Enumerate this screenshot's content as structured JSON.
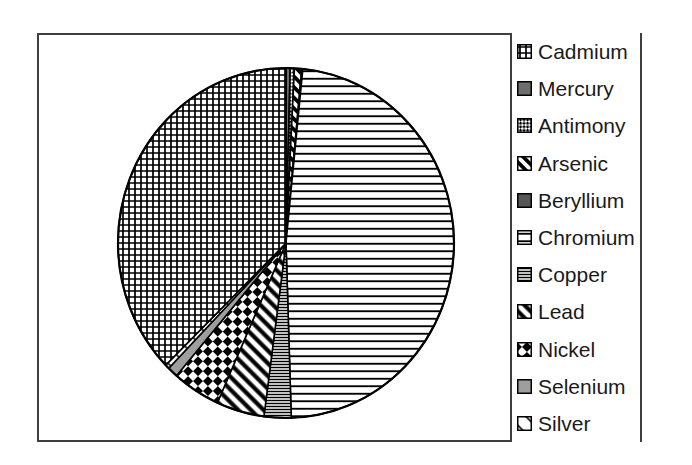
{
  "chart_data": {
    "type": "pie",
    "labels": [
      "Cadmium",
      "Mercury",
      "Antimony",
      "Arsenic",
      "Beryllium",
      "Chromium",
      "Copper",
      "Lead",
      "Nickel",
      "Selenium",
      "Silver"
    ],
    "values": [
      37.3,
      0.4,
      0.4,
      0.7,
      0.1,
      47.9,
      2.6,
      4.6,
      4.6,
      1.0,
      0.4
    ],
    "unit": "percent",
    "title": "",
    "legend_position": "right",
    "direction": "clockwise",
    "start_angle_deg": 0,
    "draw_order": [
      "Mercury",
      "Antimony",
      "Arsenic",
      "Beryllium",
      "Chromium",
      "Copper",
      "Lead",
      "Nickel",
      "Selenium",
      "Silver",
      "Cadmium"
    ]
  },
  "legend": {
    "items": [
      {
        "label": "Cadmium",
        "pattern": "crosshatch-grid"
      },
      {
        "label": "Mercury",
        "pattern": "solid-gray"
      },
      {
        "label": "Antimony",
        "pattern": "fine-diamond-check"
      },
      {
        "label": "Arsenic",
        "pattern": "thick-diagonal"
      },
      {
        "label": "Beryllium",
        "pattern": "solid-dark-gray"
      },
      {
        "label": "Chromium",
        "pattern": "sparse-horizontal"
      },
      {
        "label": "Copper",
        "pattern": "dense-horizontal"
      },
      {
        "label": "Lead",
        "pattern": "wide-diagonal"
      },
      {
        "label": "Nickel",
        "pattern": "diamond-check"
      },
      {
        "label": "Selenium",
        "pattern": "solid-light-gray"
      },
      {
        "label": "Silver",
        "pattern": "sparse-thin-diagonal"
      }
    ]
  },
  "colors": {
    "ink": "#1a1a1a",
    "line": "#000000",
    "frame": "#3f3f3f",
    "background": "#ffffff",
    "mercury_gray": "#6e6e6e",
    "beryllium_gray": "#565656",
    "selenium_gray": "#9e9e9e"
  }
}
